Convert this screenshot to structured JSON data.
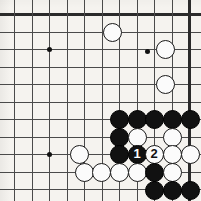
{
  "figure": {
    "kind": "go-board-diagram",
    "width": 201,
    "height": 201,
    "board_background_color": "#f5f3ef",
    "line_color": "#4a4a4a",
    "edge_color": "#2b2b2b",
    "black_stone_color": "#111111",
    "white_stone_color": "#fbfbfb",
    "grid_origin_x": 14,
    "grid_origin_y": 14,
    "grid_step": 17.5,
    "columns": 11,
    "rows": 11,
    "top_edge_is_board_edge": true,
    "right_edge_is_board_edge": true
  },
  "star_points": [
    {
      "name": "star-upper-left",
      "x": 49,
      "y": 49
    },
    {
      "name": "star-upper-right",
      "x": 147,
      "y": 51
    },
    {
      "name": "star-lower-left",
      "x": 49,
      "y": 154
    }
  ],
  "stones": [
    {
      "id": "w-c5r1",
      "color": "white",
      "x": 112,
      "y": 32,
      "label": ""
    },
    {
      "id": "w-c7r2",
      "color": "white",
      "x": 165,
      "y": 49,
      "label": ""
    },
    {
      "id": "w-c7r4",
      "color": "white",
      "x": 165,
      "y": 84,
      "label": ""
    },
    {
      "id": "b-c6r6",
      "color": "black",
      "x": 119,
      "y": 119,
      "label": ""
    },
    {
      "id": "b-c7r6",
      "color": "black",
      "x": 137,
      "y": 119,
      "label": ""
    },
    {
      "id": "b-c8r6",
      "color": "black",
      "x": 154,
      "y": 119,
      "label": ""
    },
    {
      "id": "b-c9r6",
      "color": "black",
      "x": 172,
      "y": 119,
      "label": ""
    },
    {
      "id": "b-c10r6",
      "color": "black",
      "x": 190,
      "y": 119,
      "label": ""
    },
    {
      "id": "b-c6r7",
      "color": "black",
      "x": 119,
      "y": 137,
      "label": ""
    },
    {
      "id": "w-c7r7",
      "color": "white",
      "x": 137,
      "y": 137,
      "label": ""
    },
    {
      "id": "w-c9r7",
      "color": "white",
      "x": 172,
      "y": 137,
      "label": ""
    },
    {
      "id": "w-c4r8",
      "color": "white",
      "x": 79,
      "y": 154,
      "label": ""
    },
    {
      "id": "b-c6r8",
      "color": "black",
      "x": 119,
      "y": 154,
      "label": ""
    },
    {
      "id": "b-move1",
      "color": "black",
      "x": 137,
      "y": 154,
      "label": "1"
    },
    {
      "id": "w-move2",
      "color": "white",
      "x": 154,
      "y": 154,
      "label": "2"
    },
    {
      "id": "w-c9r8",
      "color": "white",
      "x": 172,
      "y": 154,
      "label": ""
    },
    {
      "id": "w-c10r8",
      "color": "white",
      "x": 190,
      "y": 154,
      "label": ""
    },
    {
      "id": "w-c4r9",
      "color": "white",
      "x": 84,
      "y": 172,
      "label": ""
    },
    {
      "id": "w-c5r9",
      "color": "white",
      "x": 101,
      "y": 172,
      "label": ""
    },
    {
      "id": "w-c6r9",
      "color": "white",
      "x": 119,
      "y": 172,
      "label": ""
    },
    {
      "id": "w-c7r9",
      "color": "white",
      "x": 137,
      "y": 172,
      "label": ""
    },
    {
      "id": "b-c8r9",
      "color": "black",
      "x": 154,
      "y": 172,
      "label": ""
    },
    {
      "id": "w-c9r9",
      "color": "white",
      "x": 172,
      "y": 172,
      "label": ""
    },
    {
      "id": "b-c8r10",
      "color": "black",
      "x": 154,
      "y": 190,
      "label": ""
    },
    {
      "id": "b-c9r10",
      "color": "black",
      "x": 172,
      "y": 190,
      "label": ""
    },
    {
      "id": "b-c10r10",
      "color": "black",
      "x": 190,
      "y": 190,
      "label": ""
    }
  ]
}
